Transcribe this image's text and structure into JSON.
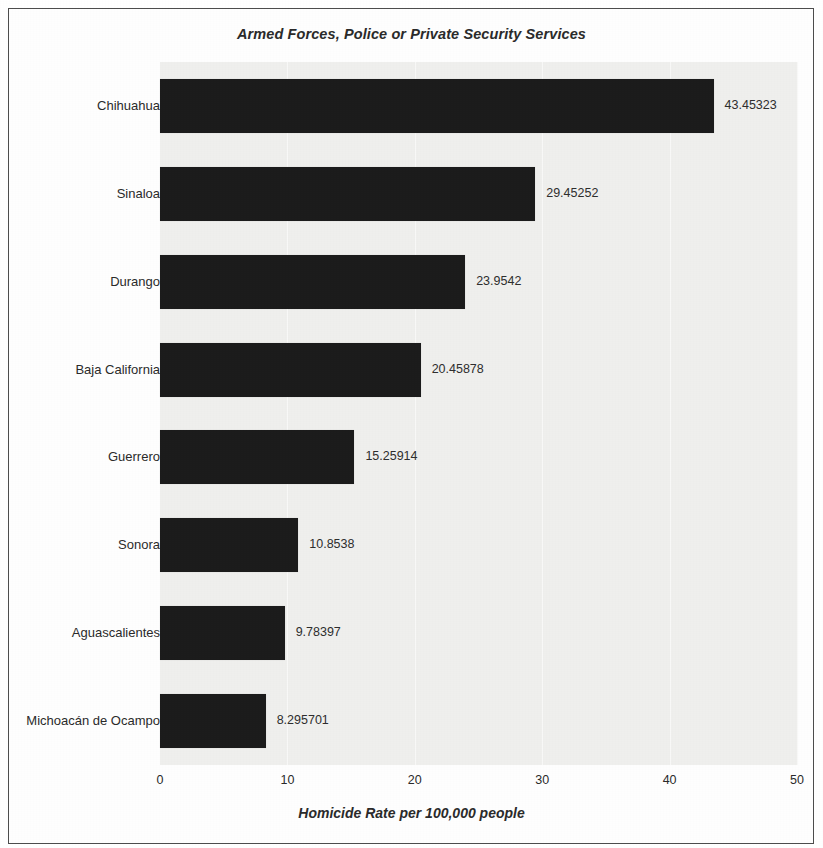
{
  "chart_data": {
    "type": "bar",
    "orientation": "horizontal",
    "title": "Armed Forces, Police or Private Security Services",
    "xlabel": "Homicide Rate per 100,000 people",
    "ylabel": "",
    "xlim": [
      0,
      50
    ],
    "xticks": [
      "0",
      "10",
      "20",
      "30",
      "40",
      "50"
    ],
    "grid": true,
    "legend": "none",
    "categories": [
      "Chihuahua",
      "Sinaloa",
      "Durango",
      "Baja California",
      "Guerrero",
      "Sonora",
      "Aguascalientes",
      "Michoacán de Ocampo"
    ],
    "values": [
      43.45323,
      29.45252,
      23.9542,
      20.45878,
      15.25914,
      10.8538,
      9.78397,
      8.295701
    ],
    "value_labels": [
      "43.45323",
      "29.45252",
      "23.9542",
      "20.45878",
      "15.25914",
      "10.8538",
      "9.78397",
      "8.295701"
    ],
    "bar_color": "#1c1c1c",
    "plot_background": "#efefed",
    "text_color": "#2b2b2b"
  }
}
